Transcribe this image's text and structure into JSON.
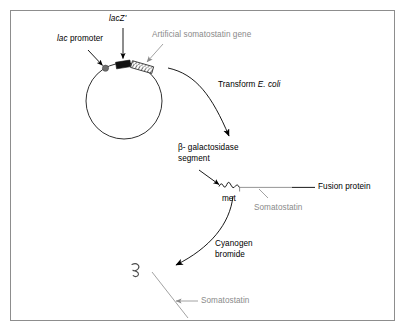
{
  "figure": {
    "title_alt": "Production of somatostatin in E. coli via lacZ' fusion",
    "colors": {
      "ink": "#000000",
      "gray_label": "#8a8a8a",
      "frame": "#8d8d8d",
      "promoter_dot": "#6f6f6f",
      "lacz_box": "#111111"
    }
  },
  "labels": {
    "lac_z_prime": {
      "italic_gene": "lacZ",
      "prime": "'"
    },
    "lac_promoter": {
      "italic_part": "lac",
      "rest": " promoter"
    },
    "artificial_gene": "Artificial somatostatin gene",
    "transform": {
      "lead": "Transform ",
      "organism": "E. coli"
    },
    "beta_gal_segment": "β- galactosidase\nsegment",
    "met": "met",
    "fusion_protein": "Fusion protein",
    "somatostatin_fusion": "Somatostatin",
    "cyanogen_bromide": "Cyanogen\nbromide",
    "somatostatin_free": "Somatostatin"
  },
  "elements": {
    "plasmid": {
      "name": "plasmid-circle",
      "cx": 124,
      "cy": 101,
      "r": 38
    },
    "promoter_marker": {
      "name": "lac-promoter-dot",
      "cx": 105.5,
      "cy": 68.5,
      "r": 3.1
    },
    "lacz_segment": {
      "name": "lacz-prime-box",
      "x": 116,
      "y": 61.5,
      "width": 14,
      "height": 6.5
    },
    "gene_segment": {
      "name": "artificial-gene-hatched-box",
      "hatch_count": 5
    },
    "fusion_protein_chain": {
      "name": "fusion-protein-chain",
      "coil_start_x": 221,
      "coil_end_x": 238,
      "line_end_x": 290,
      "y": 187
    },
    "free_peptide": {
      "name": "free-somatostatin-squiggle"
    }
  }
}
